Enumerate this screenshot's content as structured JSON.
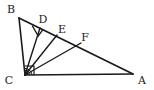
{
  "figure": {
    "background_color": "#ffffff",
    "stroke_color": "#1a1a1a",
    "label_color": "#1a1a1a",
    "width": 154,
    "height": 90
  },
  "labels": {
    "B": "B",
    "D": "D",
    "E": "E",
    "F": "F",
    "C": "C",
    "A": "A"
  },
  "geometry": {
    "points": {
      "A": {
        "x": 133,
        "y": 74,
        "label": "A",
        "label_x": 140,
        "label_y": 83
      },
      "B": {
        "x": 19,
        "y": 18,
        "label": "B",
        "label_x": 11,
        "label_y": 13
      },
      "C": {
        "x": 25,
        "y": 75,
        "label": "C",
        "label_x": 10,
        "label_y": 83
      },
      "D": {
        "x": 40,
        "y": 28,
        "label": "D",
        "label_x": 43,
        "label_y": 23
      },
      "E": {
        "x": 57,
        "y": 35,
        "label": "E",
        "label_x": 62,
        "label_y": 33
      },
      "F": {
        "x": 81,
        "y": 43,
        "label": "F",
        "label_x": 84,
        "label_y": 41
      }
    },
    "segments": [
      {
        "name": "side-BC",
        "from": "B",
        "to": "C"
      },
      {
        "name": "side-CA",
        "from": "C",
        "to": "A"
      },
      {
        "name": "hypotenuse-BA",
        "from": "B",
        "to": "A"
      },
      {
        "name": "cevian-CD",
        "from": "C",
        "to": "D"
      },
      {
        "name": "cevian-CE",
        "from": "C",
        "to": "E"
      },
      {
        "name": "cevian-CF",
        "from": "C",
        "to": "F"
      }
    ],
    "right_angles": [
      {
        "name": "right-angle-at-C",
        "vertex": "C",
        "note": "BC perpendicular CA"
      },
      {
        "name": "right-angle-at-D",
        "vertex": "D",
        "note": "CD perpendicular BA"
      }
    ],
    "angle_marks_at_C": 3
  }
}
